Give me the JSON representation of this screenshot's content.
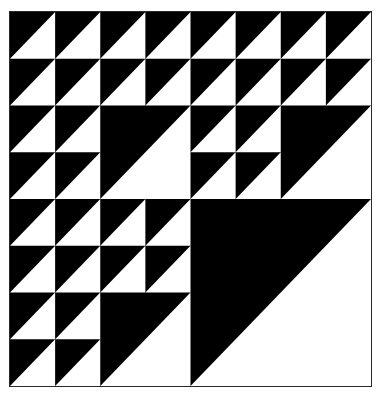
{
  "page": {
    "width": 388,
    "height": 412,
    "background_color": "#ffffff"
  },
  "frame": {
    "label": "figure border",
    "stroke_color": "#2a2a2a",
    "stroke_width": 1,
    "x": 9,
    "y": 11,
    "width": 363,
    "height": 376
  },
  "figure": {
    "name": "recursive-right-triangle-tiling",
    "foreground_color": "#000000",
    "background_color": "#ffffff",
    "origin_x": 10,
    "origin_y": 12,
    "size_width": 361,
    "size_height": 374,
    "recursion_depth": 3,
    "base_cell_size": 45,
    "quadrant_size": 180,
    "subpattern_rule": "TL, TR, BL recurse; BR = white lower-right triangle",
    "base_cell_rule": "black square with white triangle occupying the lower-right half, hypotenuse from top-left corner to bottom-right corner",
    "diagonal_direction": "top-left to bottom-right",
    "white_triangle_count": 64,
    "quadrant_labels": [
      "top-left",
      "top-right",
      "bottom-left",
      "bottom-right"
    ]
  }
}
